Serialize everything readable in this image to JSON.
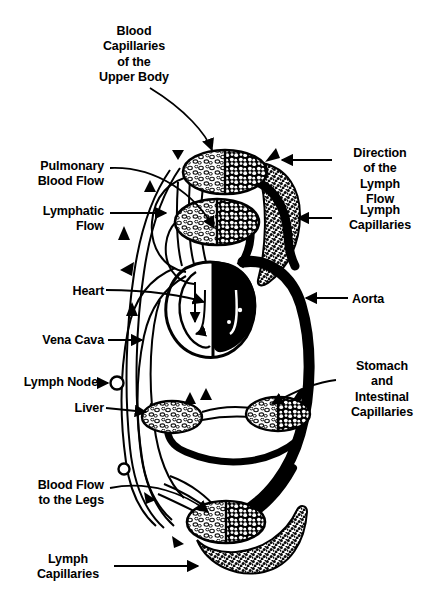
{
  "figure": {
    "title_visible": false,
    "background_color": "#ffffff",
    "ink_color": "#000000",
    "type": "anatomical-diagram"
  },
  "labels": [
    {
      "id": "blood-capillaries-upper-body",
      "text": "Blood\nCapillaries\nof the\nUpper Body",
      "align": "center",
      "x": 74,
      "y": 24,
      "width": 120
    },
    {
      "id": "direction-of-lymph-flow",
      "text": "Direction\nof the\nLymph\nFlow",
      "align": "center",
      "x": 336,
      "y": 146,
      "width": 88
    },
    {
      "id": "pulmonary-blood-flow",
      "text": "Pulmonary\nBlood Flow",
      "align": "right",
      "x": 12,
      "y": 159,
      "width": 92
    },
    {
      "id": "lymph-capillaries-right",
      "text": "Lymph\nCapillaries",
      "align": "center",
      "x": 336,
      "y": 203,
      "width": 88
    },
    {
      "id": "lymphatic-flow",
      "text": "Lymphatic\nFlow",
      "align": "right",
      "x": 12,
      "y": 204,
      "width": 92
    },
    {
      "id": "heart",
      "text": "Heart",
      "align": "right",
      "x": 28,
      "y": 284,
      "width": 76
    },
    {
      "id": "aorta",
      "text": "Aorta",
      "align": "left",
      "x": 352,
      "y": 292,
      "width": 70
    },
    {
      "id": "vena-cava",
      "text": "Vena Cava",
      "align": "right",
      "x": 20,
      "y": 333,
      "width": 84
    },
    {
      "id": "stomach-intestinal-capillaries",
      "text": "Stomach\nand\nIntestinal\nCapillaries",
      "align": "center",
      "x": 339,
      "y": 359,
      "width": 86
    },
    {
      "id": "lymph-node",
      "text": "Lymph Node",
      "align": "right",
      "x": 8,
      "y": 375,
      "width": 90
    },
    {
      "id": "liver",
      "text": "Liver",
      "align": "right",
      "x": 28,
      "y": 401,
      "width": 76
    },
    {
      "id": "blood-flow-to-the-legs",
      "text": "Blood Flow\nto the Legs",
      "align": "right",
      "x": 12,
      "y": 478,
      "width": 92
    },
    {
      "id": "lymph-capillaries-bottom",
      "text": "Lymph\nCapillaries",
      "align": "center",
      "x": 26,
      "y": 552,
      "width": 84
    }
  ],
  "anatomy": {
    "capillary_beds": [
      {
        "id": "upper-body-capillaries",
        "cx": 225,
        "cy": 172,
        "rx": 42,
        "ry": 22
      },
      {
        "id": "lung-capillaries",
        "cx": 217,
        "cy": 222,
        "rx": 42,
        "ry": 23
      },
      {
        "id": "stomach-intestinal-capillaries-bed",
        "cx": 278,
        "cy": 414,
        "rx": 32,
        "ry": 17
      },
      {
        "id": "leg-capillaries",
        "cx": 226,
        "cy": 522,
        "rx": 39,
        "ry": 21
      }
    ],
    "organs": [
      {
        "id": "liver-organ",
        "cx": 172,
        "cy": 417,
        "rx": 30,
        "ry": 16,
        "fill": "stipple"
      },
      {
        "id": "heart-organ",
        "cx": 215,
        "cy": 305,
        "note": "left chamber white, right chamber black"
      }
    ],
    "lymph_nodes": [
      {
        "id": "lymph-node-upper",
        "cx": 117,
        "cy": 383,
        "r": 6
      },
      {
        "id": "lymph-node-lower",
        "cx": 124,
        "cy": 469,
        "r": 5
      }
    ],
    "lymph_capillary_masses": [
      {
        "id": "lymph-capillary-right",
        "note": "leaf-shaped stippled mass on right upper body"
      },
      {
        "id": "lymph-capillary-bottom",
        "note": "crescent stippled mass below leg capillaries"
      }
    ],
    "flow_arrows": [
      {
        "id": "lymph-arrow-top",
        "x": 178,
        "y": 150,
        "dir": "up"
      },
      {
        "id": "lymph-arrow-upper-left",
        "x": 148,
        "y": 186,
        "dir": "down"
      },
      {
        "id": "lymph-arrow-mid-left",
        "x": 126,
        "y": 230,
        "dir": "down"
      },
      {
        "id": "lymph-arrow-diag-left",
        "x": 127,
        "y": 268,
        "dir": "up-left"
      },
      {
        "id": "vena-cava-arrow",
        "x": 132,
        "y": 311,
        "dir": "up"
      },
      {
        "id": "lymph-arrow-top-right",
        "x": 271,
        "y": 152,
        "dir": "up-right"
      },
      {
        "id": "lymph-arrow-bottom-left",
        "x": 148,
        "y": 498,
        "dir": "down-right"
      },
      {
        "id": "lymph-arrow-bottom",
        "x": 177,
        "y": 542,
        "dir": "down-right"
      }
    ]
  }
}
